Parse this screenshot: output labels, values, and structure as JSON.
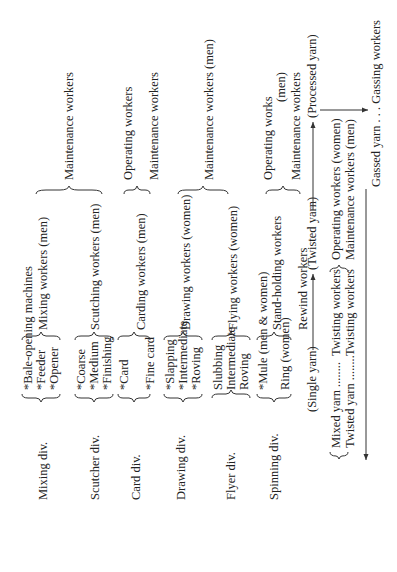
{
  "divisions": [
    {
      "label": "Mixing div.",
      "machines": [
        "*Bale-opening machines",
        "*Feeder",
        "*Opener"
      ],
      "workers": [
        "Mixing workers (men)"
      ]
    },
    {
      "label": "Scutcher div.",
      "machines": [
        "*Coarse",
        "*Medium",
        "*Finishing"
      ],
      "workers": [
        "Scutching workers (men)"
      ]
    },
    {
      "label": "Card div.",
      "machines": [
        "*Card",
        "*Fine card"
      ],
      "workers": [
        "Carding workers (men)"
      ]
    },
    {
      "label": "Drawing div.",
      "machines": [
        "*Slapping",
        "*Intermediate",
        "*Roving"
      ],
      "workers": [
        "Drawing workers (women)"
      ]
    },
    {
      "label": "Flyer div.",
      "machines": [
        "Slubbing",
        "Intermediate",
        "Roving"
      ],
      "workers": [
        "Flying workers (women)"
      ]
    },
    {
      "label": "Spinning div.",
      "machines": [
        "*Mule (men & women)",
        "Ring (women)"
      ],
      "workers": [
        "Stand-holding workers",
        "Rewind workers"
      ]
    }
  ],
  "maintenance": {
    "mixing_scutcher": "Maintenance workers",
    "card_operating": "Operating workers",
    "card_maintenance": "Maintenance workers",
    "drawing_flyer": "Maintenance workers (men)",
    "spinning_operating": "Operating works",
    "spinning_operating_note": "(men)",
    "spinning_maintenance": "Maintenance workers"
  },
  "yarn_flow": {
    "single_yarn": "(Single yarn)",
    "twisted_yarn": "(Twisted yarn)",
    "processed_yarn": "(Processed yarn)",
    "mixed_yarn": "Mixed yarn ........",
    "twisted_yarn_row": "Twisted yarn ........",
    "twisting_workers_1": "Twisting workers",
    "twisting_workers_2": "Twisting workers",
    "operating_women": "Operating workers (women)",
    "maintenance_men": "Maintenance workers (men)",
    "gassed_yarn": "Gassed yarn . . . Gassing workers"
  }
}
